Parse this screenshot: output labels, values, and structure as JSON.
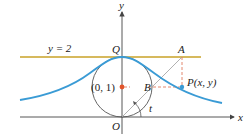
{
  "labels": {
    "y_axis": "y",
    "x_axis": "x",
    "line": "y = 2",
    "Q": "Q",
    "A": "A",
    "center": "(0, 1)",
    "B": "B",
    "P": "P(x, y)",
    "O": "O",
    "angle": "t"
  },
  "colors": {
    "curve": "#3a9bd5",
    "line_y2": "#c9a227",
    "center_dot": "#e2542a",
    "dashed": "#e07a5f",
    "axis": "#444444",
    "ray": "#a0a0a0",
    "circle": "#555555"
  }
}
